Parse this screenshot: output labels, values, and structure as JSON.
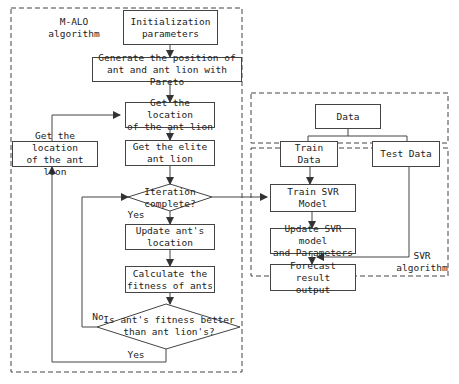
{
  "diagram": {
    "groups": [
      {
        "id": "malo",
        "label": "M-ALO\nalgorithm"
      },
      {
        "id": "data",
        "label": ""
      },
      {
        "id": "svr",
        "label": "SVR\nalgorithm"
      }
    ],
    "nodes": {
      "init": "Initialization\nparameters",
      "generate": "Generate the position of\nant and ant lion with Pareto",
      "get_location_main": "Get the location\nof the ant lion",
      "get_location_side": "Get the location\nof the ant lion",
      "get_elite": "Get the elite\nant lion",
      "iteration_complete": "Iteration\ncomplete?",
      "update_ant": "Update ant's\nlocation",
      "calc_fitness": "Calculate the\nfitness of ants",
      "fitness_better": "Is ant's fitness better\nthan ant lion's?",
      "data": "Data",
      "train_data": "Train Data",
      "test_data": "Test Data",
      "train_svr": "Train SVR Model",
      "update_svr": "Update SVR model\nand Parameters",
      "forecast": "Forecast result\noutput"
    },
    "edge_labels": {
      "iteration_yes": "Yes",
      "fitness_no": "No",
      "fitness_yes": "Yes"
    },
    "colors": {
      "stroke": "#444444",
      "background": "#ffffff"
    }
  }
}
